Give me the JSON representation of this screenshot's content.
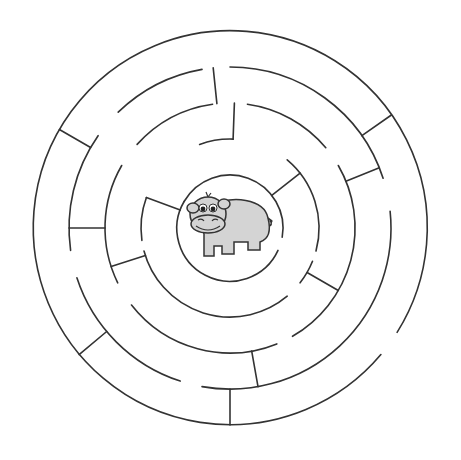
{
  "colors": {
    "background": "#ffffff",
    "wall": "#333333",
    "hippo_fill": "#d4d4d4",
    "hippo_outline": "#333333"
  },
  "maze": {
    "center": [
      230,
      228
    ],
    "rings": [
      {
        "r": 197,
        "arcs": [
          [
            130,
            482
          ]
        ]
      },
      {
        "r": 161,
        "arcs": [
          [
            0,
            72
          ],
          [
            84,
            190
          ],
          [
            198,
            252
          ],
          [
            262,
            305
          ],
          [
            316,
            350
          ]
        ]
      },
      {
        "r": 125,
        "arcs": [
          [
            8,
            50
          ],
          [
            60,
            150
          ],
          [
            158,
            232
          ],
          [
            244,
            300
          ],
          [
            312,
            352
          ]
        ]
      },
      {
        "r": 89,
        "arcs": [
          [
            -20,
            2
          ],
          [
            40,
            105
          ],
          [
            112,
            128
          ],
          [
            140,
            255
          ],
          [
            262,
            290
          ]
        ]
      },
      {
        "r": 53,
        "arcs": [
          [
            -60,
            100
          ],
          [
            115,
            300
          ]
        ]
      }
    ],
    "walls": [
      [
        300,
        161,
        197
      ],
      [
        -6,
        125,
        161
      ],
      [
        55,
        161,
        197
      ],
      [
        68,
        125,
        161
      ],
      [
        120,
        89,
        125
      ],
      [
        170,
        125,
        161
      ],
      [
        180,
        161,
        197
      ],
      [
        230,
        161,
        197
      ],
      [
        252,
        89,
        125
      ],
      [
        270,
        125,
        161
      ],
      [
        290,
        53,
        89
      ],
      [
        2,
        89,
        125
      ],
      [
        52,
        53,
        89
      ]
    ]
  },
  "center_character": {
    "name": "hippo",
    "icon": "hippo-icon"
  }
}
